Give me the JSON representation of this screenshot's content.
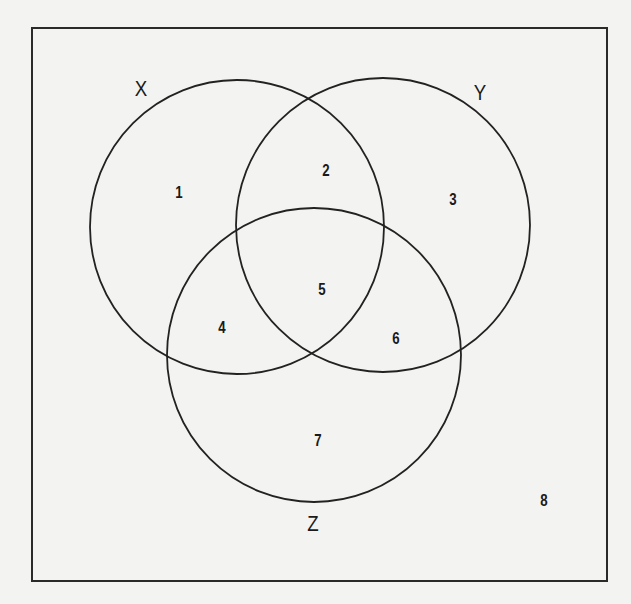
{
  "diagram": {
    "type": "venn-3",
    "universe": {
      "x": 32,
      "y": 28,
      "width": 575,
      "height": 553,
      "stroke": "#2a2a2a"
    },
    "circle_stroke": "#222222",
    "sets": [
      {
        "id": "X",
        "label": "X",
        "cx": 237,
        "cy": 227,
        "r": 147,
        "label_x": 141,
        "label_y": 89
      },
      {
        "id": "Y",
        "label": "Y",
        "cx": 383,
        "cy": 225,
        "r": 147,
        "label_x": 480,
        "label_y": 93
      },
      {
        "id": "Z",
        "label": "Z",
        "cx": 314,
        "cy": 355,
        "r": 147,
        "label_x": 313,
        "label_y": 524
      }
    ],
    "regions": [
      {
        "label": "1",
        "x": 179,
        "y": 192,
        "description": "X only"
      },
      {
        "label": "2",
        "x": 326,
        "y": 170,
        "description": "X and Y only"
      },
      {
        "label": "3",
        "x": 453,
        "y": 199,
        "description": "Y only"
      },
      {
        "label": "4",
        "x": 222,
        "y": 327,
        "description": "X and Z only"
      },
      {
        "label": "5",
        "x": 322,
        "y": 289,
        "description": "X, Y and Z"
      },
      {
        "label": "6",
        "x": 396,
        "y": 338,
        "description": "Y and Z only"
      },
      {
        "label": "7",
        "x": 318,
        "y": 440,
        "description": "Z only"
      },
      {
        "label": "8",
        "x": 544,
        "y": 500,
        "description": "outside X, Y, Z"
      }
    ]
  }
}
